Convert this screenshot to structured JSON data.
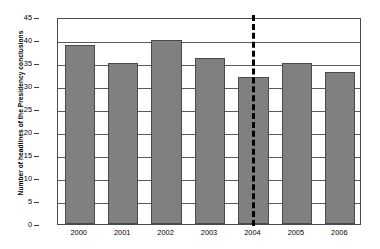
{
  "chart_data": {
    "type": "bar",
    "title": "",
    "subtitle": "",
    "xlabel": "",
    "ylabel": "Number of headlines of the Presidency conclusions",
    "categories": [
      "2000",
      "2001",
      "2002",
      "2003",
      "2004",
      "2005",
      "2006"
    ],
    "values": [
      39,
      35,
      40,
      36,
      32,
      35,
      33
    ],
    "ylim": [
      0,
      45
    ],
    "ytick_step": 5,
    "yticks": [
      "0",
      "5",
      "10",
      "15",
      "20",
      "25",
      "30",
      "35",
      "40",
      "45"
    ],
    "grid": true,
    "grid_axis": "y",
    "legend": false,
    "legend_position": "none",
    "bar_color": "#808080",
    "bar_edge_color": "#4a4a4a",
    "axis_color": "#4a4a4a",
    "grid_color": "#5a5a5a",
    "annotations": [
      {
        "type": "vertical-dashed-line",
        "at_category": "2004",
        "color": "#000000",
        "label": ""
      }
    ]
  }
}
